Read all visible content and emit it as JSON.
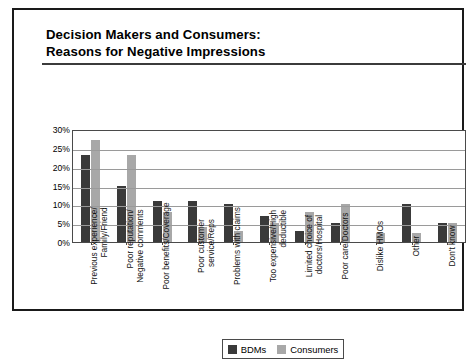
{
  "chart_data": {
    "type": "bar",
    "title": "Decision Makers and Consumers:\nReasons for Negative Impressions",
    "title_line1": "Decision Makers and Consumers:",
    "title_line2": "Reasons for Negative Impressions",
    "xlabel": "",
    "ylabel": "",
    "ylim": [
      0,
      30
    ],
    "ytick_labels": [
      "30%",
      "25%",
      "20%",
      "15%",
      "10%",
      "5%",
      "0%"
    ],
    "ytick_values": [
      30,
      25,
      20,
      15,
      10,
      5,
      0
    ],
    "grid": true,
    "legend_position": "bottom-center",
    "categories": [
      "Previous experience/\nFamily/Friend",
      "Poor reputation/\nNegative comments",
      "Poor benefits/Coverage",
      "Poor customer\nservice/Reps",
      "Problems with claims",
      "Too expensive/High\ndeductible",
      "Limited choice of\ndoctors/Hospital",
      "Poor care/Doctors",
      "Dislike HMOs",
      "Other",
      "Don't know"
    ],
    "series": [
      {
        "name": "BDMs",
        "color": "#3a3a3a",
        "values": [
          23,
          15,
          11,
          11,
          10,
          7,
          3,
          5,
          0,
          10,
          5
        ]
      },
      {
        "name": "Consumers",
        "color": "#a8a8a8",
        "values": [
          27,
          23,
          8,
          4,
          3,
          5,
          8,
          10,
          2.5,
          2.5,
          5
        ]
      }
    ]
  },
  "legend": {
    "items": [
      {
        "label": "BDMs",
        "color": "#3a3a3a"
      },
      {
        "label": "Consumers",
        "color": "#a8a8a8"
      }
    ]
  }
}
